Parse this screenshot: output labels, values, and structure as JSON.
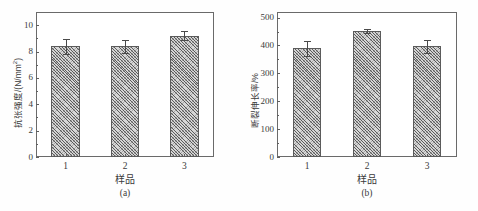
{
  "figure": {
    "background": "#ffffff",
    "bar_fill": "#d6d6d6",
    "bar_edge": "#5b5b5b",
    "axis_color": "#5e5e5e"
  },
  "chart_data": [
    {
      "type": "bar",
      "panel_id": "a",
      "caption": "(a)",
      "title": "",
      "categories": [
        "1",
        "2",
        "3"
      ],
      "values": [
        8.4,
        8.4,
        9.2
      ],
      "errors": [
        0.55,
        0.5,
        0.35
      ],
      "xlabel": "样品",
      "ylabel": "抗张强度/(N/mm",
      "ylabel_sup": "2",
      "ylabel_tail": ")",
      "ylabel_full": "抗张强度/(N/mm2)",
      "ylim": [
        0,
        11
      ],
      "yticks": [
        0,
        2,
        4,
        6,
        8,
        10
      ],
      "ytick_labels": [
        "0",
        "2",
        "4",
        "6",
        "8",
        "10"
      ],
      "grid": false,
      "legend": false
    },
    {
      "type": "bar",
      "panel_id": "b",
      "caption": "(b)",
      "title": "",
      "categories": [
        "1",
        "2",
        "3"
      ],
      "values": [
        390,
        452,
        397
      ],
      "errors": [
        26,
        8,
        24
      ],
      "xlabel": "样品",
      "ylabel": "断裂伸长率/%",
      "ylim": [
        0,
        520
      ],
      "yticks": [
        0,
        100,
        200,
        300,
        400,
        500
      ],
      "ytick_labels": [
        "0",
        "100",
        "200",
        "300",
        "400",
        "500"
      ],
      "grid": false,
      "legend": false
    }
  ]
}
